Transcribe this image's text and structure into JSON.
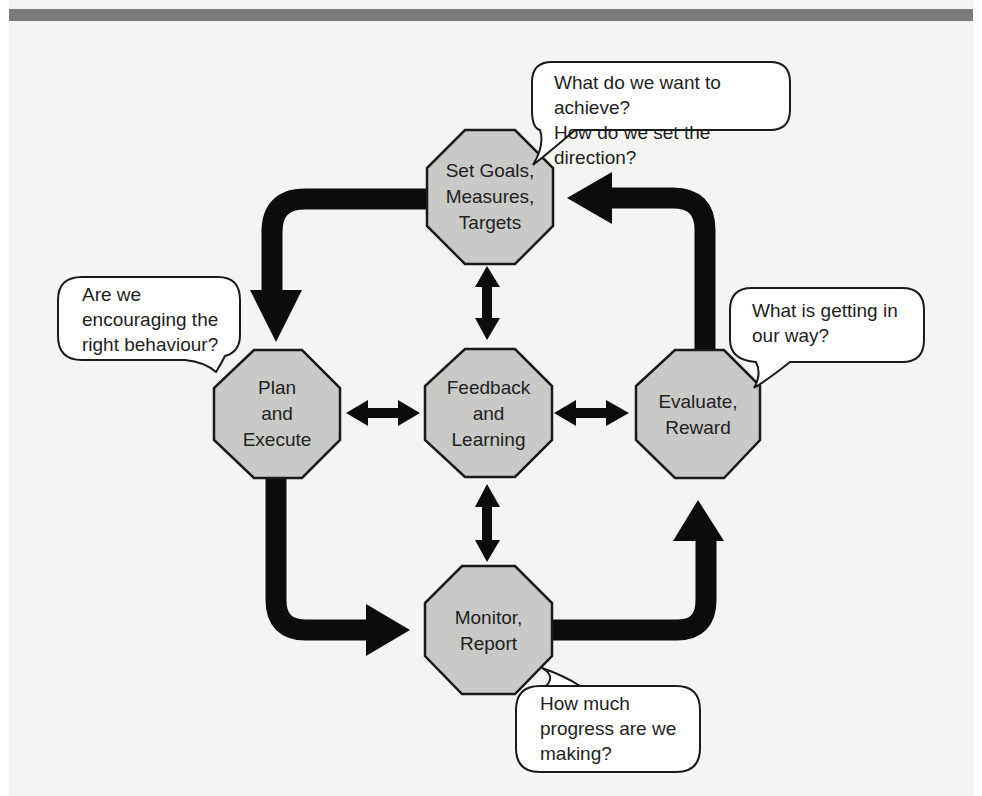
{
  "diagram": {
    "title": "",
    "colors": {
      "node_fill": "#c9c9c7",
      "node_stroke": "#1a1a1a",
      "arrow": "#0c0c0c",
      "bubble_fill": "#ffffff",
      "page_bg": "#f4f4f2",
      "top_bar": "#7b7b7b"
    },
    "nodes": {
      "set_goals": {
        "label": "Set Goals,\nMeasures,\nTargets",
        "shape": "octagon"
      },
      "plan_execute": {
        "label": "Plan\nand\nExecute",
        "shape": "octagon"
      },
      "feedback_learning": {
        "label": "Feedback\nand\nLearning",
        "shape": "octagon"
      },
      "evaluate_reward": {
        "label": "Evaluate,\nReward",
        "shape": "octagon"
      },
      "monitor_report": {
        "label": "Monitor,\nReport",
        "shape": "octagon"
      }
    },
    "bubbles": {
      "set_goals_question": {
        "text": "What do we want to achieve?\nHow do we set the direction?",
        "attached_to": "set_goals"
      },
      "plan_question": {
        "text": "Are we\nencouraging the\nright behaviour?",
        "attached_to": "plan_execute"
      },
      "evaluate_question": {
        "text": "What is getting in\nour way?",
        "attached_to": "evaluate_reward"
      },
      "monitor_question": {
        "text": "How much\nprogress are we\nmaking?",
        "attached_to": "monitor_report"
      }
    },
    "edges": [
      {
        "from": "set_goals",
        "to": "plan_execute",
        "type": "curved-arrow"
      },
      {
        "from": "plan_execute",
        "to": "monitor_report",
        "type": "curved-arrow"
      },
      {
        "from": "monitor_report",
        "to": "evaluate_reward",
        "type": "curved-arrow"
      },
      {
        "from": "evaluate_reward",
        "to": "set_goals",
        "type": "curved-arrow"
      },
      {
        "from": "feedback_learning",
        "to": "set_goals",
        "type": "double-arrow"
      },
      {
        "from": "feedback_learning",
        "to": "plan_execute",
        "type": "double-arrow"
      },
      {
        "from": "feedback_learning",
        "to": "evaluate_reward",
        "type": "double-arrow"
      },
      {
        "from": "feedback_learning",
        "to": "monitor_report",
        "type": "double-arrow"
      }
    ]
  }
}
